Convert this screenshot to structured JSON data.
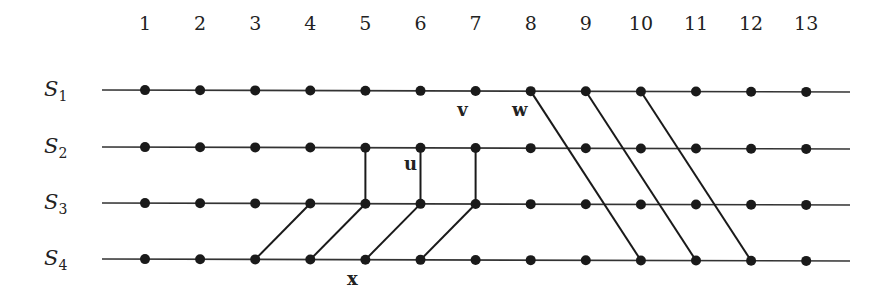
{
  "diagram": {
    "type": "space-time process diagram",
    "columns": [
      "1",
      "2",
      "3",
      "4",
      "5",
      "6",
      "7",
      "8",
      "9",
      "10",
      "11",
      "12",
      "13"
    ],
    "rows": [
      {
        "id": "S1",
        "base": "S",
        "sub": "1"
      },
      {
        "id": "S2",
        "base": "S",
        "sub": "2"
      },
      {
        "id": "S3",
        "base": "S",
        "sub": "3"
      },
      {
        "id": "S4",
        "base": "S",
        "sub": "4"
      }
    ],
    "edges": [
      {
        "from": {
          "row": "S2",
          "col": 5
        },
        "to": {
          "row": "S3",
          "col": 5
        },
        "kind": "vertical"
      },
      {
        "from": {
          "row": "S2",
          "col": 6
        },
        "to": {
          "row": "S3",
          "col": 6
        },
        "kind": "vertical"
      },
      {
        "from": {
          "row": "S2",
          "col": 7
        },
        "to": {
          "row": "S3",
          "col": 7
        },
        "kind": "vertical"
      },
      {
        "from": {
          "row": "S4",
          "col": 3
        },
        "to": {
          "row": "S3",
          "col": 4
        },
        "kind": "diagonal"
      },
      {
        "from": {
          "row": "S4",
          "col": 4
        },
        "to": {
          "row": "S3",
          "col": 5
        },
        "kind": "diagonal"
      },
      {
        "from": {
          "row": "S4",
          "col": 5
        },
        "to": {
          "row": "S3",
          "col": 6
        },
        "kind": "diagonal"
      },
      {
        "from": {
          "row": "S4",
          "col": 6
        },
        "to": {
          "row": "S3",
          "col": 7
        },
        "kind": "diagonal"
      },
      {
        "from": {
          "row": "S1",
          "col": 8
        },
        "to": {
          "row": "S4",
          "col": 10
        },
        "kind": "diagonal"
      },
      {
        "from": {
          "row": "S1",
          "col": 9
        },
        "to": {
          "row": "S4",
          "col": 11
        },
        "kind": "diagonal"
      },
      {
        "from": {
          "row": "S1",
          "col": 10
        },
        "to": {
          "row": "S4",
          "col": 12
        },
        "kind": "diagonal"
      }
    ],
    "point_labels": [
      {
        "text": "v",
        "near": {
          "row": "S1",
          "col": 7
        }
      },
      {
        "text": "w",
        "near": {
          "row": "S1",
          "col": 8
        }
      },
      {
        "text": "u",
        "near": {
          "row": "S2",
          "col": 6
        }
      },
      {
        "text": "x",
        "near": {
          "row": "S4",
          "col": 5
        }
      }
    ],
    "colors": {
      "line": "#333333",
      "node": "#1a1a1a",
      "text": "#222222",
      "background": "#ffffff"
    }
  }
}
